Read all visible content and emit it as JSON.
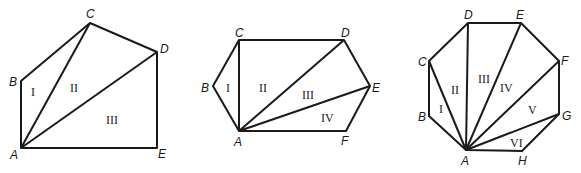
{
  "figures": [
    {
      "name": "pentagon",
      "vertices": {
        "A": [
          21,
          148
        ],
        "B": [
          21,
          81
        ],
        "C": [
          90,
          23
        ],
        "D": [
          157,
          52
        ],
        "E": [
          157,
          148
        ]
      },
      "polygon": [
        "A",
        "B",
        "C",
        "D",
        "E"
      ],
      "diagonals": [
        [
          "A",
          "C"
        ],
        [
          "A",
          "D"
        ]
      ],
      "vertex_labels": [
        {
          "text": "A",
          "x": 10,
          "y": 159
        },
        {
          "text": "B",
          "x": 9,
          "y": 86
        },
        {
          "text": "C",
          "x": 86,
          "y": 18
        },
        {
          "text": "D",
          "x": 160,
          "y": 53
        },
        {
          "text": "E",
          "x": 158,
          "y": 158
        }
      ],
      "region_labels": [
        {
          "text": "I",
          "x": 31,
          "y": 96
        },
        {
          "text": "II",
          "x": 70,
          "y": 92
        },
        {
          "text": "III",
          "x": 106,
          "y": 124
        }
      ]
    },
    {
      "name": "hexagon",
      "vertices": {
        "A": [
          239,
          131
        ],
        "B": [
          213,
          86
        ],
        "C": [
          239,
          40
        ],
        "D": [
          344,
          40
        ],
        "E": [
          370,
          86
        ],
        "F": [
          346,
          131
        ]
      },
      "polygon": [
        "A",
        "B",
        "C",
        "D",
        "E",
        "F"
      ],
      "diagonals": [
        [
          "A",
          "C"
        ],
        [
          "A",
          "D"
        ],
        [
          "A",
          "E"
        ]
      ],
      "vertex_labels": [
        {
          "text": "A",
          "x": 234,
          "y": 146
        },
        {
          "text": "B",
          "x": 201,
          "y": 92
        },
        {
          "text": "C",
          "x": 235,
          "y": 37
        },
        {
          "text": "D",
          "x": 341,
          "y": 37
        },
        {
          "text": "E",
          "x": 372,
          "y": 92
        },
        {
          "text": "F",
          "x": 341,
          "y": 145
        }
      ],
      "region_labels": [
        {
          "text": "I",
          "x": 226,
          "y": 92
        },
        {
          "text": "II",
          "x": 259,
          "y": 92
        },
        {
          "text": "III",
          "x": 302,
          "y": 99
        },
        {
          "text": "IV",
          "x": 321,
          "y": 122
        }
      ]
    },
    {
      "name": "octagon",
      "vertices": {
        "A": [
          466,
          150
        ],
        "B": [
          429,
          116
        ],
        "C": [
          429,
          61
        ],
        "D": [
          468,
          23
        ],
        "E": [
          521,
          23
        ],
        "F": [
          559,
          61
        ],
        "G": [
          559,
          114
        ],
        "H": [
          522,
          151
        ]
      },
      "polygon": [
        "A",
        "B",
        "C",
        "D",
        "E",
        "F",
        "G",
        "H"
      ],
      "diagonals": [
        [
          "A",
          "C"
        ],
        [
          "A",
          "D"
        ],
        [
          "A",
          "E"
        ],
        [
          "A",
          "F"
        ],
        [
          "A",
          "G"
        ]
      ],
      "vertex_labels": [
        {
          "text": "A",
          "x": 461,
          "y": 165
        },
        {
          "text": "B",
          "x": 418,
          "y": 121
        },
        {
          "text": "C",
          "x": 418,
          "y": 66
        },
        {
          "text": "D",
          "x": 464,
          "y": 19
        },
        {
          "text": "E",
          "x": 516,
          "y": 19
        },
        {
          "text": "F",
          "x": 561,
          "y": 65
        },
        {
          "text": "G",
          "x": 562,
          "y": 120
        },
        {
          "text": "H",
          "x": 518,
          "y": 165
        }
      ],
      "region_labels": [
        {
          "text": "I",
          "x": 439,
          "y": 113
        },
        {
          "text": "II",
          "x": 451,
          "y": 94
        },
        {
          "text": "III",
          "x": 478,
          "y": 83
        },
        {
          "text": "IV",
          "x": 500,
          "y": 92
        },
        {
          "text": "V",
          "x": 528,
          "y": 114
        },
        {
          "text": "VI",
          "x": 510,
          "y": 147
        }
      ]
    }
  ]
}
